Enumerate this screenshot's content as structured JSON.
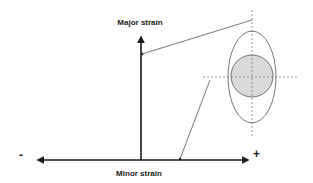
{
  "diagram": {
    "y_axis": {
      "label": "Major strain"
    },
    "x_axis": {
      "label": "Minor strain",
      "negative_sign": "-",
      "positive_sign": "+"
    },
    "inset": {
      "shapes": [
        "ellipse (deformed)",
        "circle (original, gray fill)"
      ],
      "circle_fill": "#d9d9d9",
      "stroke": "#555555",
      "guides": "dashed crosshair"
    },
    "colors": {
      "axis": "#1a1a1a",
      "leader": "#555555"
    }
  }
}
